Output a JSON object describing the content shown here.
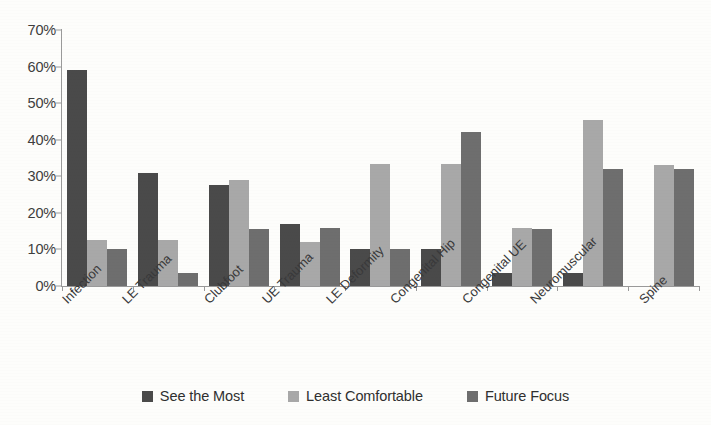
{
  "chart_data": {
    "type": "bar",
    "title": "",
    "subtitle": "",
    "xlabel": "",
    "ylabel": "",
    "grid": false,
    "legend_position": "bottom",
    "ylim": [
      0,
      70
    ],
    "ytick_labels": [
      "0%",
      "10%",
      "20%",
      "30%",
      "40%",
      "50%",
      "60%",
      "70%"
    ],
    "ytick_values": [
      0,
      10,
      20,
      30,
      40,
      50,
      60,
      70
    ],
    "value_unit": "%",
    "categories": [
      "Infection",
      "LE Trauma",
      "Clubfoot",
      "UE Trauma",
      "LE Deformity",
      "Congenital Hip",
      "Congenital UE",
      "Neuromuscular",
      "Spine"
    ],
    "series": [
      {
        "name": "See the Most",
        "color": "#4a4a4a",
        "values": [
          59,
          31,
          27.5,
          17,
          10,
          10,
          3.5,
          3.5,
          0
        ]
      },
      {
        "name": "Least Comfortable",
        "color": "#a8a8a8",
        "values": [
          12.5,
          12.5,
          29,
          12,
          33.5,
          33.5,
          16,
          45.5,
          33
        ]
      },
      {
        "name": "Future Focus",
        "color": "#6e6e6e",
        "values": [
          10,
          3.5,
          15.5,
          16,
          10,
          42,
          15.5,
          32,
          32
        ]
      }
    ]
  },
  "legend": {
    "items": [
      {
        "label": "See the Most"
      },
      {
        "label": "Least Comfortable"
      },
      {
        "label": "Future Focus"
      }
    ]
  }
}
